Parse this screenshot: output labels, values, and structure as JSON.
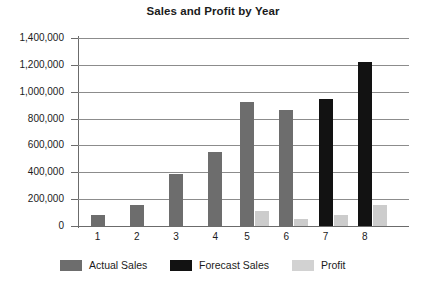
{
  "chart_data": {
    "type": "bar",
    "title": "Sales and Profit by Year",
    "xlabel": "",
    "ylabel": "",
    "categories": [
      "1",
      "2",
      "3",
      "4",
      "5",
      "6",
      "7",
      "8"
    ],
    "ylim": [
      0,
      1400000
    ],
    "ytick_values": [
      0,
      200000,
      400000,
      600000,
      800000,
      1000000,
      1200000,
      1400000
    ],
    "ytick_labels": [
      "0",
      "200,000",
      "400,000",
      "600,000",
      "800,000",
      "1,000,000",
      "1,200,000",
      "1,400,000"
    ],
    "grid": true,
    "legend_position": "bottom",
    "series": [
      {
        "name": "Actual Sales",
        "color": "#6d6d6d",
        "values": [
          85000,
          160000,
          385000,
          550000,
          920000,
          862000,
          null,
          null
        ]
      },
      {
        "name": "Forecast Sales",
        "color": "#121212",
        "values": [
          null,
          null,
          null,
          null,
          null,
          null,
          945000,
          1225000
        ]
      },
      {
        "name": "Profit",
        "color": "#cccccc",
        "values": [
          null,
          null,
          null,
          null,
          110000,
          55000,
          85000,
          155000
        ]
      }
    ]
  },
  "legend": {
    "items": [
      {
        "label": "Actual Sales",
        "swatch": "actual"
      },
      {
        "label": "Forecast Sales",
        "swatch": "forecast"
      },
      {
        "label": "Profit",
        "swatch": "profit"
      }
    ]
  }
}
